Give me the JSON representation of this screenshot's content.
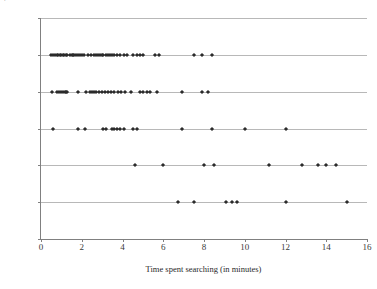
{
  "chart_data": {
    "type": "scatter",
    "title": "",
    "xlabel": "Time spent searching (in minutes)",
    "ylabel_line1": "Perceptions of having enough search time",
    "ylabel_line2": "(5-point rating scale)",
    "xlim": [
      0,
      16
    ],
    "ylim": [
      0,
      6
    ],
    "xticks": [
      0,
      2,
      4,
      6,
      8,
      10,
      12,
      14,
      16
    ],
    "yticks": [
      0,
      1,
      2,
      3,
      4,
      5,
      6
    ],
    "grid": "horizontal",
    "legend": "none",
    "marker": "diamond",
    "marker_color": "#2b2b2b",
    "gridline_color": "#b8b8b8",
    "axis_color": "#808080",
    "series": [
      {
        "name": "rating 5",
        "y": 5,
        "x": [
          0.5,
          0.6,
          0.7,
          0.8,
          0.85,
          0.95,
          1.0,
          1.1,
          1.15,
          1.25,
          1.3,
          1.4,
          1.5,
          1.55,
          1.6,
          1.7,
          1.8,
          1.9,
          2.0,
          2.1,
          2.3,
          2.45,
          2.6,
          2.7,
          2.8,
          2.9,
          3.0,
          3.05,
          3.2,
          3.3,
          3.4,
          3.5,
          3.6,
          3.75,
          3.9,
          4.05,
          4.2,
          4.5,
          4.7,
          4.85,
          5.0,
          5.6,
          5.8,
          7.5,
          7.9,
          8.4
        ]
      },
      {
        "name": "rating 4",
        "y": 4,
        "x": [
          0.55,
          0.8,
          0.9,
          1.0,
          1.1,
          1.2,
          1.25,
          1.3,
          1.8,
          2.2,
          2.4,
          2.5,
          2.6,
          2.7,
          2.85,
          3.0,
          3.15,
          3.3,
          3.45,
          3.6,
          3.8,
          3.95,
          4.1,
          4.4,
          4.85,
          5.0,
          5.2,
          5.35,
          5.7,
          6.9,
          7.9,
          8.2
        ]
      },
      {
        "name": "rating 3",
        "y": 3,
        "x": [
          0.6,
          1.8,
          2.15,
          3.05,
          3.2,
          3.5,
          3.6,
          3.75,
          3.9,
          4.05,
          4.5,
          4.7,
          6.9,
          8.4,
          10.0,
          12.0
        ]
      },
      {
        "name": "rating 2",
        "y": 2,
        "x": [
          4.6,
          6.0,
          8.0,
          8.5,
          11.2,
          12.8,
          13.6,
          14.0,
          14.5
        ]
      },
      {
        "name": "rating 1",
        "y": 1,
        "x": [
          6.7,
          7.5,
          9.1,
          9.35,
          9.6,
          12.0,
          15.0
        ]
      }
    ]
  }
}
